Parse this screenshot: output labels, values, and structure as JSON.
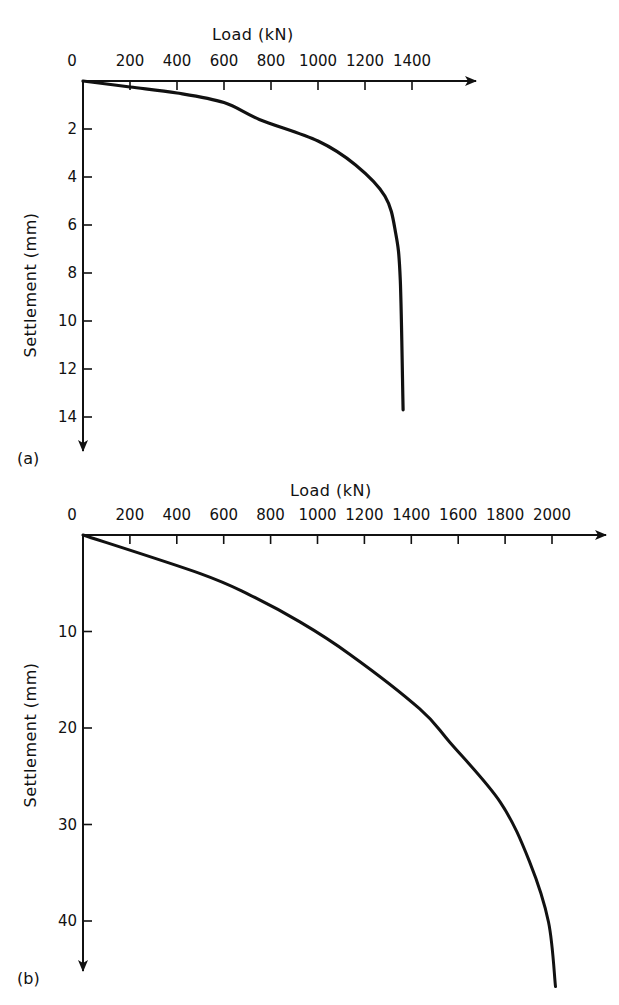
{
  "figure": {
    "panels": [
      {
        "id": "a",
        "label": "(a)"
      },
      {
        "id": "b",
        "label": "(b)"
      }
    ],
    "colors": {
      "background": "#ffffff",
      "ink": "#111111"
    }
  },
  "chart_data": [
    {
      "type": "line",
      "panel": "(a)",
      "title": "",
      "xlabel": "Load (kN)",
      "ylabel": "Settlement (mm)",
      "x_axis_position": "top",
      "y_axis_inverted": true,
      "xlim": [
        0,
        1500
      ],
      "ylim": [
        0,
        15
      ],
      "x_ticks": [
        0,
        200,
        400,
        600,
        800,
        1000,
        1200,
        1400
      ],
      "y_ticks": [
        2,
        4,
        6,
        8,
        10,
        12,
        14
      ],
      "grid": false,
      "legend": null,
      "series": [
        {
          "name": "Load-settlement curve (a)",
          "x": [
            0,
            200,
            400,
            600,
            750,
            1000,
            1160,
            1285,
            1330,
            1350,
            1362
          ],
          "y": [
            0,
            0.25,
            0.5,
            0.9,
            1.6,
            2.5,
            3.5,
            4.8,
            6.3,
            8.3,
            13.7
          ]
        }
      ]
    },
    {
      "type": "line",
      "panel": "(b)",
      "title": "",
      "xlabel": "Load (kN)",
      "ylabel": "Settlement (mm)",
      "x_axis_position": "top",
      "y_axis_inverted": true,
      "xlim": [
        0,
        2200
      ],
      "ylim": [
        0,
        47
      ],
      "x_ticks": [
        0,
        200,
        400,
        600,
        800,
        1000,
        1200,
        1400,
        1600,
        1800,
        2000
      ],
      "y_ticks": [
        10,
        20,
        30,
        40
      ],
      "grid": false,
      "legend": null,
      "series": [
        {
          "name": "Load-settlement curve (b)",
          "x": [
            0,
            500,
            710,
            925,
            1140,
            1435,
            1565,
            1780,
            1905,
            1985,
            2015
          ],
          "y": [
            0,
            4.0,
            6.2,
            9.0,
            12.4,
            18.0,
            21.5,
            27.7,
            33.9,
            40.1,
            46.8
          ]
        }
      ]
    }
  ]
}
